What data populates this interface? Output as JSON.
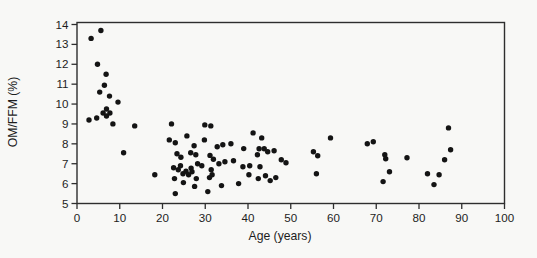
{
  "chart_data": {
    "type": "scatter",
    "xlabel": "Age (years)",
    "ylabel": "OM/FFM (%)",
    "xlim": [
      0,
      100
    ],
    "ylim": [
      5,
      14
    ],
    "x_ticks": [
      0,
      10,
      20,
      30,
      40,
      50,
      60,
      70,
      80,
      90,
      100
    ],
    "y_ticks": [
      5,
      6,
      7,
      8,
      9,
      10,
      11,
      12,
      13,
      14
    ],
    "grid": false,
    "legend": false,
    "marker": "filled-circle",
    "colors": {
      "dot": "#141414",
      "axis": "#2e2e2e",
      "text": "#1d1d1d",
      "background": "#f8f8f6"
    },
    "points": [
      [
        3.3,
        13.3
      ],
      [
        5.6,
        13.7
      ],
      [
        4.8,
        12.0
      ],
      [
        6.8,
        11.5
      ],
      [
        6.4,
        10.95
      ],
      [
        5.3,
        10.6
      ],
      [
        7.6,
        10.4
      ],
      [
        9.6,
        10.1
      ],
      [
        6.9,
        9.75
      ],
      [
        6.1,
        9.55
      ],
      [
        7.7,
        9.55
      ],
      [
        6.9,
        9.4
      ],
      [
        4.6,
        9.3
      ],
      [
        2.8,
        9.2
      ],
      [
        8.4,
        9.0
      ],
      [
        13.5,
        8.9
      ],
      [
        10.9,
        7.55
      ],
      [
        18.2,
        6.45
      ],
      [
        22.1,
        9.0
      ],
      [
        21.6,
        8.2
      ],
      [
        23.0,
        8.05
      ],
      [
        23.4,
        7.5
      ],
      [
        24.3,
        7.33
      ],
      [
        22.6,
        6.8
      ],
      [
        23.7,
        6.7
      ],
      [
        24.2,
        6.9
      ],
      [
        24.8,
        6.5
      ],
      [
        22.8,
        6.25
      ],
      [
        24.9,
        6.05
      ],
      [
        23.0,
        5.5
      ],
      [
        25.7,
        8.4
      ],
      [
        27.4,
        7.9
      ],
      [
        29.9,
        8.95
      ],
      [
        31.3,
        8.9
      ],
      [
        29.8,
        8.2
      ],
      [
        26.6,
        7.55
      ],
      [
        27.8,
        7.45
      ],
      [
        26.7,
        6.78
      ],
      [
        28.2,
        7.0
      ],
      [
        29.2,
        6.9
      ],
      [
        25.5,
        6.62
      ],
      [
        26.9,
        6.6
      ],
      [
        26.1,
        6.45
      ],
      [
        27.9,
        6.25
      ],
      [
        27.5,
        5.86
      ],
      [
        31.1,
        7.42
      ],
      [
        31.9,
        7.22
      ],
      [
        31.4,
        6.7
      ],
      [
        31.6,
        6.45
      ],
      [
        31.0,
        6.3
      ],
      [
        30.6,
        5.6
      ],
      [
        32.8,
        7.85
      ],
      [
        34.1,
        7.95
      ],
      [
        36.0,
        8.0
      ],
      [
        33.2,
        7.0
      ],
      [
        34.6,
        7.1
      ],
      [
        36.6,
        7.15
      ],
      [
        33.8,
        5.9
      ],
      [
        37.8,
        6.0
      ],
      [
        39.0,
        7.76
      ],
      [
        41.2,
        8.55
      ],
      [
        43.2,
        8.3
      ],
      [
        42.6,
        7.75
      ],
      [
        43.8,
        7.75
      ],
      [
        44.6,
        7.6
      ],
      [
        42.2,
        7.45
      ],
      [
        38.8,
        6.85
      ],
      [
        40.4,
        6.9
      ],
      [
        42.8,
        6.85
      ],
      [
        40.2,
        6.45
      ],
      [
        42.4,
        6.25
      ],
      [
        44.1,
        6.4
      ],
      [
        45.2,
        6.15
      ],
      [
        46.5,
        6.3
      ],
      [
        46.1,
        7.65
      ],
      [
        47.8,
        7.2
      ],
      [
        48.9,
        7.05
      ],
      [
        55.3,
        7.6
      ],
      [
        56.3,
        7.4
      ],
      [
        56.0,
        6.5
      ],
      [
        59.3,
        8.3
      ],
      [
        67.9,
        8.0
      ],
      [
        69.3,
        8.1
      ],
      [
        72.0,
        7.45
      ],
      [
        72.2,
        7.25
      ],
      [
        73.1,
        6.6
      ],
      [
        71.6,
        6.1
      ],
      [
        77.2,
        7.3
      ],
      [
        82.0,
        6.5
      ],
      [
        84.7,
        6.45
      ],
      [
        83.5,
        5.95
      ],
      [
        86.0,
        7.2
      ],
      [
        87.4,
        7.7
      ],
      [
        86.9,
        8.8
      ]
    ]
  }
}
